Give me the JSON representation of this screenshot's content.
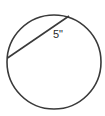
{
  "diagram": {
    "type": "geometry",
    "shape": "circle",
    "elements": [
      {
        "kind": "circle",
        "name": "circle-outline"
      },
      {
        "kind": "chord",
        "name": "chord"
      }
    ],
    "chord_label": "5\"",
    "stroke_color": "#3a3a3a",
    "label_color": "#2a2a2a",
    "background_color": "#ffffff"
  }
}
